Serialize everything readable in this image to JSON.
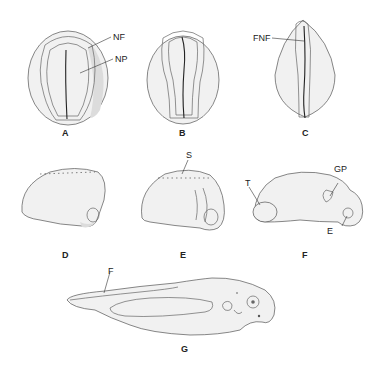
{
  "figure": {
    "panels": [
      {
        "id": "A",
        "label": "A",
        "annotations": [
          "NF",
          "NP"
        ]
      },
      {
        "id": "B",
        "label": "B",
        "annotations": []
      },
      {
        "id": "C",
        "label": "C",
        "annotations": [
          "FNF"
        ]
      },
      {
        "id": "D",
        "label": "D",
        "annotations": []
      },
      {
        "id": "E",
        "label": "E",
        "annotations": [
          "S"
        ]
      },
      {
        "id": "F",
        "label": "F",
        "annotations": [
          "T",
          "GP",
          "E"
        ]
      },
      {
        "id": "G",
        "label": "G",
        "annotations": [
          "F"
        ]
      }
    ],
    "annotations": {
      "nf": "NF",
      "np": "NP",
      "fnf": "FNF",
      "s": "S",
      "t": "T",
      "gp": "GP",
      "e": "E",
      "f": "F"
    }
  }
}
